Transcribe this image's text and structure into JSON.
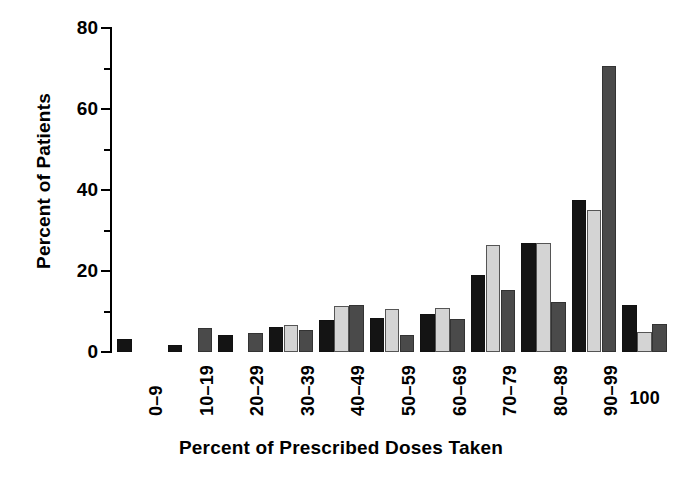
{
  "chart_data": {
    "type": "bar",
    "title": "",
    "xlabel": "Percent of Prescribed Doses Taken",
    "ylabel": "Percent of Patients",
    "ylim": [
      0,
      80
    ],
    "y_major_ticks": [
      0,
      20,
      40,
      60,
      80
    ],
    "y_minor_ticks": [
      10,
      30,
      50,
      70
    ],
    "y_tick_labels": [
      "0",
      "20",
      "40",
      "60",
      "80"
    ],
    "grid": false,
    "legend": "none",
    "categories": [
      "0–9",
      "10–19",
      "20–29",
      "30–39",
      "40–49",
      "50–59",
      "60–69",
      "70–79",
      "80–89",
      "90–99",
      "100"
    ],
    "series": [
      {
        "name": "series-1",
        "color": "#141414",
        "values": [
          3.2,
          1.8,
          4.2,
          6.2,
          7.8,
          8.5,
          9.3,
          19.0,
          27.0,
          37.5,
          11.5
        ]
      },
      {
        "name": "series-2",
        "color": "#d4d4d4",
        "values": [
          0,
          0,
          0,
          6.6,
          11.3,
          10.6,
          10.8,
          26.5,
          27.0,
          35.0,
          5.0
        ]
      },
      {
        "name": "series-3",
        "color": "#4a4a4a",
        "values": [
          0,
          5.9,
          4.6,
          5.4,
          11.5,
          4.2,
          8.2,
          15.2,
          12.3,
          70.5,
          7.0
        ]
      }
    ]
  }
}
